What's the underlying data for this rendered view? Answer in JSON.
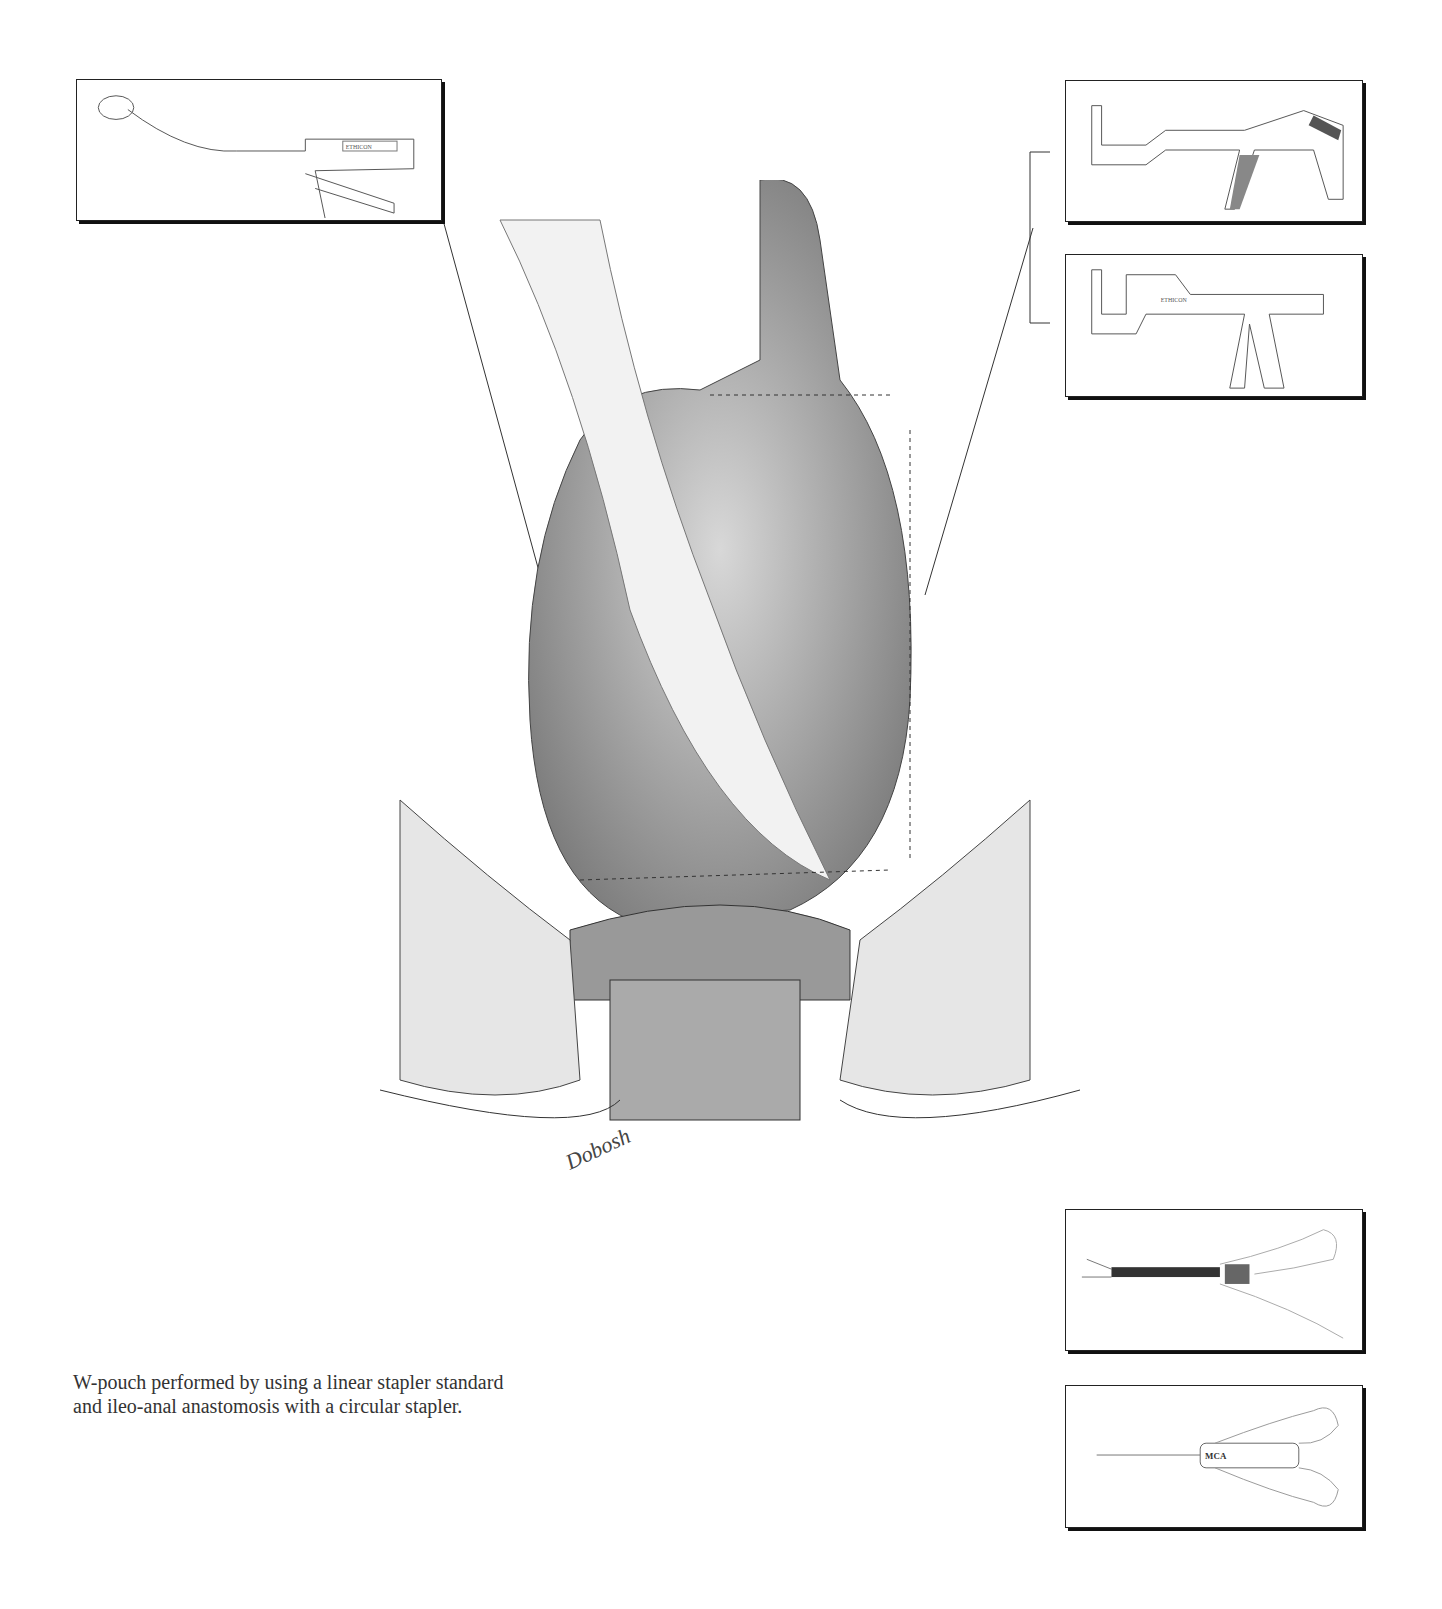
{
  "caption": {
    "line1": "W-pouch performed by using a linear stapler standard",
    "line2": "and ileo-anal anastomosis with a circular stapler."
  },
  "insets": [
    {
      "id": "circular-stapler",
      "brand": "ETHICON",
      "model": "ILS"
    },
    {
      "id": "linear-stapler-tl",
      "brand": "",
      "model": ""
    },
    {
      "id": "linear-stapler-tx",
      "brand": "ETHICON",
      "model": "LINEAR STAPLER 60"
    },
    {
      "id": "clip-applier-lc",
      "brand": "",
      "model": "LC"
    },
    {
      "id": "ligaclip-mca",
      "brand": "LIGACLIP",
      "model": "MCA"
    }
  ],
  "signature": "Dobosh"
}
